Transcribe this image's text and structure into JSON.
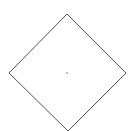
{
  "diagram": {
    "shape": "diamond",
    "stroke_color": "#555555",
    "fill_color": "#ffffff",
    "vertices": {
      "top": [
        67,
        14
      ],
      "right": [
        126,
        73
      ],
      "bottom": [
        68,
        131
      ],
      "left": [
        9,
        73
      ]
    },
    "center_mark": {
      "x": 67,
      "y": 73,
      "color": "#888888"
    }
  }
}
